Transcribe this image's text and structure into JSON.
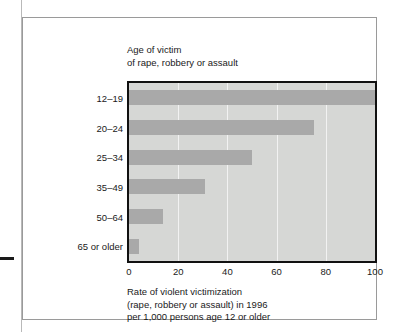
{
  "chart_data": {
    "type": "bar",
    "orientation": "horizontal",
    "title": "",
    "header_lines": [
      "Age of victim",
      "of rape, robbery or assault"
    ],
    "categories": [
      "12–19",
      "20–24",
      "25–34",
      "35–49",
      "50–64",
      "65 or older"
    ],
    "values": [
      100,
      75,
      50,
      31,
      14,
      4
    ],
    "xlabel": "",
    "ylabel": "",
    "xlim": [
      0,
      100
    ],
    "xticks": [
      "0",
      "20",
      "40",
      "60",
      "80",
      "100"
    ],
    "xtick_values": [
      0,
      20,
      40,
      60,
      80,
      100
    ],
    "grid": true,
    "legend": false,
    "caption_lines": [
      "Rate of violent victimization",
      "(rape, robbery or assault) in 1996",
      "per 1,000 persons age 12 or older"
    ],
    "colors": {
      "bar": "#a9a9a9",
      "plot_background": "#d6d7d5",
      "gridline": "#f2f2f2",
      "axis_frame": "#111111",
      "text": "#1a1a1a",
      "page_background": "#ffffff",
      "figure_border": "#9a9a9a"
    }
  }
}
